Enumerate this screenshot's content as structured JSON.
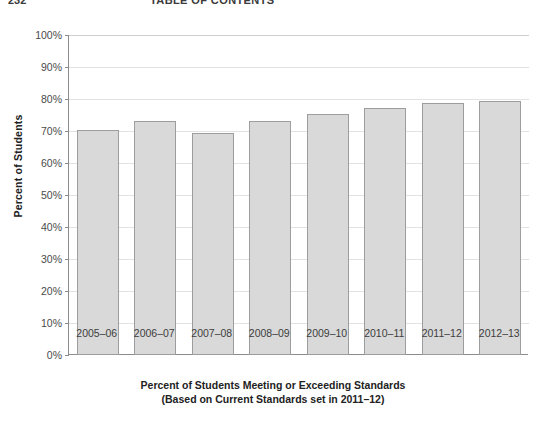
{
  "page_header": {
    "folio": "232",
    "running_title": "TABLE OF CONTENTS"
  },
  "caption": {
    "line1": "Percent of Students Meeting or Exceeding Standards",
    "line2": "(Based on Current Standards set in 2011–12)"
  },
  "chart_data": {
    "type": "bar",
    "title": "",
    "subtitle": "",
    "xlabel": "",
    "ylabel": "Percent of Students",
    "ylim": [
      0,
      100
    ],
    "grid": true,
    "legend": false,
    "categories": [
      "2005–06",
      "2006–07",
      "2007–08",
      "2008–09",
      "2009–10",
      "2010–11",
      "2011–12",
      "2012–13"
    ],
    "values": [
      70.2,
      73.2,
      69.4,
      73.2,
      75.3,
      77.3,
      78.6,
      79.5
    ],
    "ytick_labels": [
      "0%",
      "10%",
      "20%",
      "30%",
      "40%",
      "50%",
      "60%",
      "70%",
      "80%",
      "90%",
      "100%"
    ],
    "ytick_values": [
      0,
      10,
      20,
      30,
      40,
      50,
      60,
      70,
      80,
      90,
      100
    ],
    "colors": {
      "bar_fill": "#d9d9d9",
      "bar_border": "#9d9d9d",
      "gridline": "#e2e2e2",
      "axis": "#8c8c8c",
      "text": "#333333"
    }
  }
}
